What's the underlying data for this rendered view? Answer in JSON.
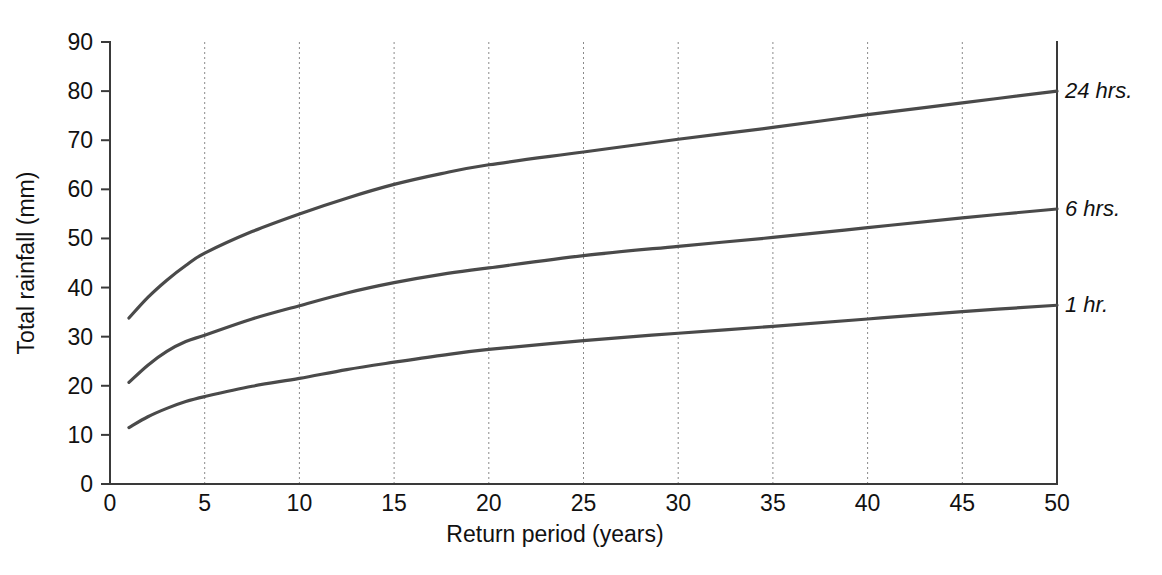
{
  "chart_data": {
    "type": "line",
    "title": "",
    "subtitle": "",
    "xlabel": "Return  period  (years)",
    "ylabel": "Total rainfall (mm)",
    "xlim": [
      0,
      50
    ],
    "ylim": [
      0,
      90
    ],
    "xticks": [
      0,
      5,
      10,
      15,
      20,
      25,
      30,
      35,
      40,
      45,
      50
    ],
    "yticks": [
      0,
      10,
      20,
      30,
      40,
      50,
      60,
      70,
      80,
      90
    ],
    "xtick_labels": [
      "0",
      "5",
      "10",
      "15",
      "20",
      "25",
      "30",
      "35",
      "40",
      "45",
      "50"
    ],
    "ytick_labels": [
      "0",
      "10",
      "20",
      "30",
      "40",
      "50",
      "60",
      "70",
      "80",
      "90"
    ],
    "grid": "vertical-dotted-at-xticks",
    "legend_position": "right-of-plot-inline-labels",
    "line_color": "#4a4a4a",
    "axis_color": "#3a3a3a",
    "grid_color": "#8a8a8a",
    "background_color": "#ffffff",
    "x": [
      1,
      2,
      3,
      4,
      5,
      7.5,
      10,
      12.5,
      15,
      17.5,
      20,
      25,
      30,
      35,
      40,
      45,
      50
    ],
    "series": [
      {
        "name": "24 hrs.",
        "label": "24 hrs.",
        "values": [
          33.8,
          38.0,
          41.5,
          44.5,
          47.0,
          51.4,
          55.0,
          58.2,
          61.0,
          63.2,
          65.0,
          67.6,
          70.2,
          72.6,
          75.2,
          77.6,
          80.0
        ]
      },
      {
        "name": "6 hrs.",
        "label": "6 hrs.",
        "values": [
          20.7,
          24.2,
          27.0,
          29.0,
          30.3,
          33.6,
          36.3,
          38.9,
          41.0,
          42.7,
          44.0,
          46.5,
          48.4,
          50.2,
          52.2,
          54.2,
          56.0
        ]
      },
      {
        "name": "1 hr.",
        "label": "1 hr.",
        "values": [
          11.5,
          13.7,
          15.4,
          16.8,
          17.8,
          19.9,
          21.5,
          23.3,
          24.8,
          26.2,
          27.4,
          29.2,
          30.7,
          32.1,
          33.6,
          35.1,
          36.4
        ]
      }
    ],
    "annotations": [
      {
        "text": "24 hrs.",
        "x": 50,
        "y": 80.0
      },
      {
        "text": "6 hrs.",
        "x": 50,
        "y": 56.0
      },
      {
        "text": "1 hr.",
        "x": 50,
        "y": 36.4
      }
    ]
  }
}
